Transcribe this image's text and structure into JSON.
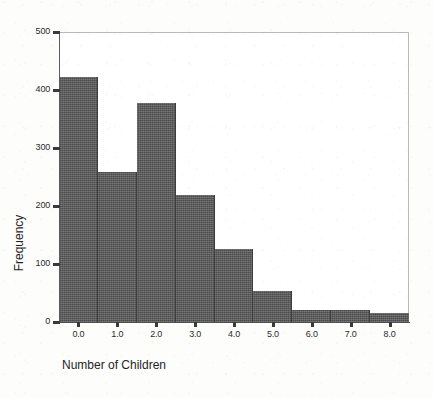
{
  "chart_data": {
    "type": "bar",
    "title": "",
    "xlabel": "Number of Children",
    "ylabel": "Frequency",
    "categories": [
      "0.0",
      "1.0",
      "2.0",
      "3.0",
      "4.0",
      "5.0",
      "6.0",
      "7.0",
      "8.0"
    ],
    "values": [
      422,
      259,
      378,
      219,
      126,
      53,
      21,
      21,
      16
    ],
    "x": [
      0,
      1,
      2,
      3,
      4,
      5,
      6,
      7,
      8
    ],
    "xlim": [
      -0.5,
      8.5
    ],
    "ylim": [
      0,
      500
    ],
    "x_tick_labels": [
      "0.0",
      "1.0",
      "2.0",
      "3.0",
      "4.0",
      "5.0",
      "6.0",
      "7.0",
      "8.0"
    ],
    "y_tick_labels": [
      "0",
      "100",
      "200",
      "300",
      "400",
      "500"
    ],
    "y_ticks": [
      0,
      100,
      200,
      300,
      400,
      500
    ],
    "grid": false,
    "legend": null,
    "bar_color": "#5a5a5a",
    "bar_edge_color": "#3d3d3d",
    "frame_color": "#b9b9b9",
    "axis_color": "#4f4f4f",
    "text_color": "#1f1f1f",
    "background": "#ffffff",
    "bin_width": 1,
    "bar_width_fraction": 1.0
  },
  "axes": {
    "y_title": "Frequency",
    "x_title": "Number of Children"
  }
}
